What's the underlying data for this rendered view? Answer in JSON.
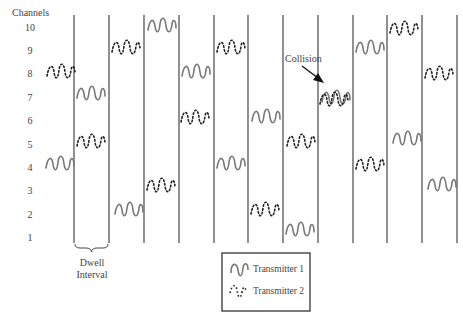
{
  "diagram": {
    "y_axis_title": "Channels",
    "channels": [
      "10",
      "9",
      "8",
      "7",
      "6",
      "5",
      "4",
      "3",
      "2",
      "1"
    ],
    "dwell_label_line1": "Dwell",
    "dwell_label_line2": "Interval",
    "collision_label": "Collision",
    "legend": {
      "t1_label": "Transmitter 1",
      "t2_label": "Transmitter 2"
    },
    "colors": {
      "line": "#555555",
      "transmitter1": "#777777",
      "transmitter2": "#222222",
      "text": "#444444"
    },
    "interval_boundaries_x": [
      74,
      109,
      144,
      179,
      214,
      248,
      283,
      318,
      353,
      387,
      422,
      457
    ],
    "hops": [
      {
        "interval": 0,
        "transmitter": 2,
        "channel": 8
      },
      {
        "interval": 0,
        "transmitter": 1,
        "channel": 4
      },
      {
        "interval": 1,
        "transmitter": 1,
        "channel": 7
      },
      {
        "interval": 1,
        "transmitter": 2,
        "channel": 5
      },
      {
        "interval": 2,
        "transmitter": 2,
        "channel": 9
      },
      {
        "interval": 2,
        "transmitter": 1,
        "channel": 2
      },
      {
        "interval": 3,
        "transmitter": 1,
        "channel": 10
      },
      {
        "interval": 3,
        "transmitter": 2,
        "channel": 3
      },
      {
        "interval": 4,
        "transmitter": 1,
        "channel": 8
      },
      {
        "interval": 4,
        "transmitter": 2,
        "channel": 6
      },
      {
        "interval": 5,
        "transmitter": 2,
        "channel": 9
      },
      {
        "interval": 5,
        "transmitter": 1,
        "channel": 4
      },
      {
        "interval": 6,
        "transmitter": 1,
        "channel": 6
      },
      {
        "interval": 6,
        "transmitter": 2,
        "channel": 2
      },
      {
        "interval": 7,
        "transmitter": 2,
        "channel": 5
      },
      {
        "interval": 7,
        "transmitter": 1,
        "channel": 1
      },
      {
        "interval": 8,
        "transmitter": 1,
        "channel": 7
      },
      {
        "interval": 8,
        "transmitter": 2,
        "channel": 7
      },
      {
        "interval": 9,
        "transmitter": 1,
        "channel": 9
      },
      {
        "interval": 9,
        "transmitter": 2,
        "channel": 4
      },
      {
        "interval": 10,
        "transmitter": 2,
        "channel": 10
      },
      {
        "interval": 10,
        "transmitter": 1,
        "channel": 5
      },
      {
        "interval": 11,
        "transmitter": 2,
        "channel": 8
      },
      {
        "interval": 11,
        "transmitter": 1,
        "channel": 3
      }
    ]
  }
}
